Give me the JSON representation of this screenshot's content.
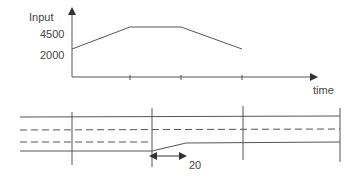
{
  "top_chart": {
    "y_axis_label": "Input",
    "y_ticks": [
      "4500",
      "2000"
    ],
    "x_axis_label": "time",
    "profile": [
      {
        "x": 72,
        "y": 49
      },
      {
        "x": 130,
        "y": 27
      },
      {
        "x": 181,
        "y": 27
      },
      {
        "x": 242,
        "y": 49
      }
    ],
    "x_ticks": [
      130,
      181,
      242
    ]
  },
  "bottom_diagram": {
    "dimension_label": "20"
  },
  "colors": {
    "line": "#555555",
    "text": "#444444",
    "background": "#ffffff"
  }
}
